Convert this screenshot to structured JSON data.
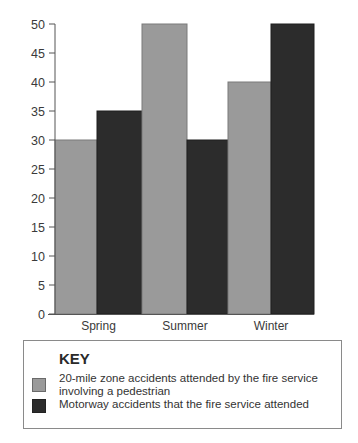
{
  "chart_data": {
    "type": "bar",
    "title": "",
    "xlabel": "",
    "ylabel": "",
    "categories": [
      "Spring",
      "Summer",
      "Winter"
    ],
    "series": [
      {
        "name": "20-mile zone accidents attended by the fire service involving a pedestrian",
        "color": "#9a9a9a",
        "values": [
          30,
          50,
          40
        ]
      },
      {
        "name": "Motorway accidents that the fire service attended",
        "color": "#2c2c2c",
        "values": [
          35,
          30,
          50
        ]
      }
    ],
    "ylim": [
      0,
      50
    ],
    "yticks": [
      0,
      5,
      10,
      15,
      20,
      25,
      30,
      35,
      40,
      45,
      50
    ],
    "grid": false,
    "legend_position": "bottom"
  },
  "legend": {
    "title": "KEY",
    "items": [
      {
        "label_line1": "20-mile zone accidents attended by the fire service",
        "label_line2": "involving a pedestrian"
      },
      {
        "label_line1": "Motorway accidents that the fire service attended",
        "label_line2": ""
      }
    ]
  }
}
